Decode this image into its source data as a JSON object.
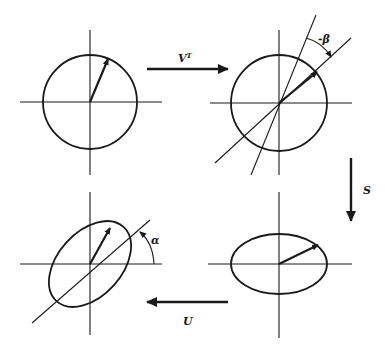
{
  "diagram": {
    "panels": [
      {
        "id": "original",
        "shape": "circle",
        "position": "top-left"
      },
      {
        "id": "rotated",
        "shape": "circle",
        "position": "top-right",
        "angle_label": "-β"
      },
      {
        "id": "scaled",
        "shape": "ellipse",
        "position": "bottom-right"
      },
      {
        "id": "final",
        "shape": "rotated-ellipse",
        "position": "bottom-left",
        "angle_label": "α"
      }
    ],
    "transitions": [
      {
        "label": "V",
        "superscript": "T",
        "from": "original",
        "to": "rotated",
        "direction": "right"
      },
      {
        "label": "S",
        "from": "rotated",
        "to": "scaled",
        "direction": "down"
      },
      {
        "label": "U",
        "from": "scaled",
        "to": "final",
        "direction": "left"
      }
    ],
    "colors": {
      "ink": "#1a1a1a",
      "background": "#ffffff"
    }
  }
}
